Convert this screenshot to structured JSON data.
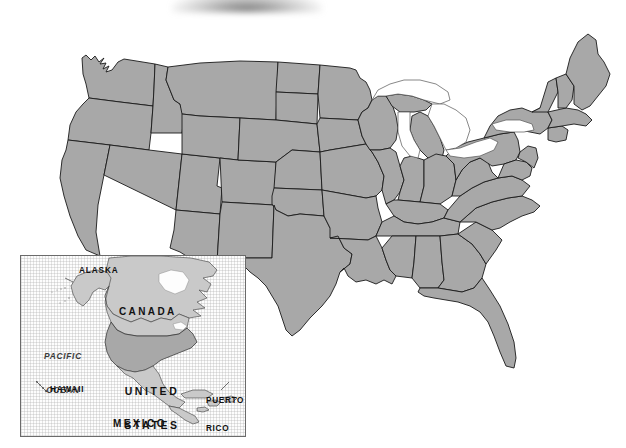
{
  "document": {
    "type": "map",
    "title": "Map of the United States with North America inset",
    "width": 626,
    "height": 448
  },
  "colors": {
    "land_fill": "#a8a8a8",
    "border_stroke": "#1a1a1a",
    "lake_fill": "#ffffff",
    "background": "#ffffff",
    "inset_neighbor_fill": "#c9c9c9",
    "inset_frame": "#6b6b6b"
  },
  "main_map": {
    "name": "contiguous-united-states",
    "label_text": "",
    "features": {
      "great_lakes": [
        "Lake Superior",
        "Lake Michigan",
        "Lake Huron",
        "Lake Erie",
        "Lake Ontario"
      ],
      "state_borders_visible": true,
      "state_labels_visible": false
    }
  },
  "inset": {
    "name": "north-america-locator",
    "frame": {
      "x": 20,
      "y": 255,
      "width": 226,
      "height": 182
    },
    "labels": [
      {
        "id": "alaska",
        "text": "ALASKA",
        "x": 62,
        "y": 270,
        "style": "small"
      },
      {
        "id": "canada",
        "text": "CANADA",
        "x": 118,
        "y": 310,
        "style": "country"
      },
      {
        "id": "pacific_ocean",
        "line1": "PACIFIC",
        "line2": "OCEAN",
        "x": 33,
        "y": 333,
        "style": "ocean"
      },
      {
        "id": "united_states",
        "line1": "UNITED",
        "line2": "STATES",
        "x": 118,
        "y": 368,
        "style": "us"
      },
      {
        "id": "hawaii",
        "text": "HAWAII",
        "x": 33,
        "y": 388,
        "style": "small"
      },
      {
        "id": "puerto_rico",
        "line1": "PUERTO",
        "line2": "RICO",
        "x": 205,
        "y": 381,
        "style": "pr"
      },
      {
        "id": "mexico",
        "text": "MEXICO",
        "x": 112,
        "y": 421,
        "style": "country"
      }
    ],
    "text": {
      "alaska": "ALASKA",
      "canada": "CANADA",
      "pacific_line1": "PACIFIC",
      "pacific_line2": "OCEAN",
      "us_line1": "UNITED",
      "us_line2": "STATES",
      "hawaii": "HAWAII",
      "pr_line1": "PUERTO",
      "pr_line2": "RICO",
      "mexico": "MEXICO"
    }
  }
}
